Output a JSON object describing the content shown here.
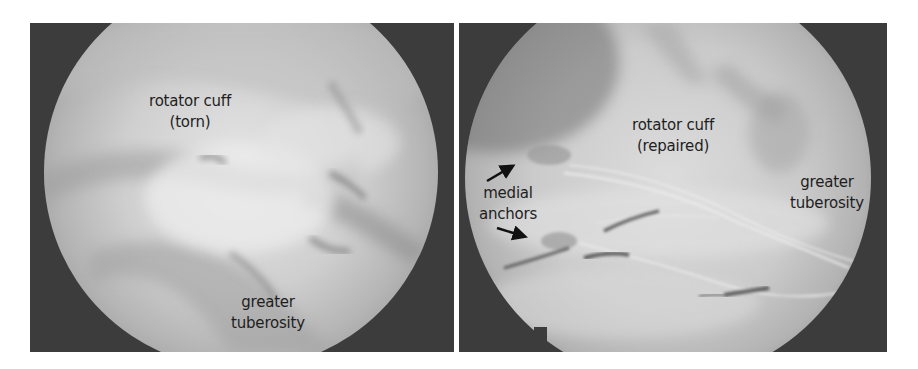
{
  "figure": {
    "panels": [
      {
        "id": "left",
        "description": "arthroscopic view before repair",
        "labels": {
          "cuff_line1": "rotator cuff",
          "cuff_line2": "(torn)",
          "tuberosity_line1": "greater",
          "tuberosity_line2": "tuberosity"
        }
      },
      {
        "id": "right",
        "description": "arthroscopic view after repair",
        "labels": {
          "cuff_line1": "rotator cuff",
          "cuff_line2": "(repaired)",
          "anchors_line1": "medial",
          "anchors_line2": "anchors",
          "tuberosity_line1": "greater",
          "tuberosity_line2": "tuberosity"
        },
        "arrows": [
          {
            "name": "arrow-to-upper-anchor",
            "direction": "up-right"
          },
          {
            "name": "arrow-to-lower-anchor",
            "direction": "right"
          }
        ]
      }
    ],
    "colors": {
      "background": "#ffffff",
      "scope_border": "#3c3c3c",
      "tissue_light": "#d9d9d9",
      "tissue_mid": "#b4b4b4",
      "tissue_dark": "#8a8a8a",
      "suture_dark": "#4a4a4a",
      "label_text": "#1e1e1e"
    }
  }
}
